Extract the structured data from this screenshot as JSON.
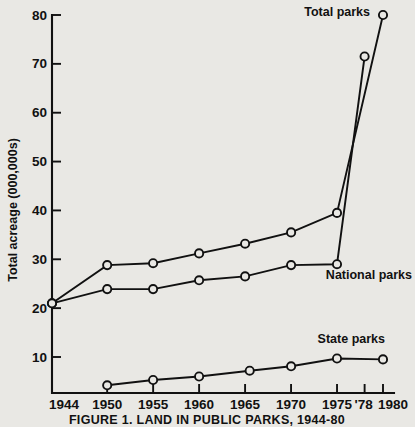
{
  "chart_data": {
    "type": "line",
    "title": "",
    "caption": "FIGURE 1.  LAND IN PUBLIC PARKS, 1944-80",
    "xlabel": "",
    "ylabel": "Total acreage (000,000s)",
    "x_tick_labels": [
      "1944",
      "1950",
      "1955",
      "1960",
      "1965",
      "1970",
      "1975",
      "'78",
      "1980"
    ],
    "x_tick_values": [
      1944,
      1950,
      1955,
      1960,
      1965,
      1970,
      1975,
      1978,
      1980
    ],
    "y_tick_labels": [
      "10",
      "20",
      "30",
      "40",
      "50",
      "60",
      "70",
      "80"
    ],
    "y_tick_values": [
      10,
      20,
      30,
      40,
      50,
      60,
      70,
      80
    ],
    "xlim": [
      1944,
      1980
    ],
    "ylim": [
      2,
      82
    ],
    "grid": false,
    "legend_position": "inline-annotations",
    "marker": "open-circle",
    "line_color": "#111111",
    "background_color": "#e9e8e4",
    "series": [
      {
        "name": "Total parks",
        "label": "Total parks",
        "x": [
          1944,
          1950,
          1955,
          1960,
          1965,
          1970,
          1975,
          1980
        ],
        "values": [
          21.0,
          28.8,
          29.2,
          31.2,
          33.2,
          35.5,
          39.5,
          80.0
        ]
      },
      {
        "name": "National parks",
        "label": "National parks",
        "x": [
          1944,
          1950,
          1955,
          1960,
          1965,
          1970,
          1975,
          1978
        ],
        "values": [
          21.0,
          23.9,
          23.9,
          25.7,
          26.5,
          28.8,
          29.0,
          71.5
        ]
      },
      {
        "name": "State parks",
        "label": "State parks",
        "x": [
          1950,
          1955,
          1960,
          1965.5,
          1970,
          1975,
          1980
        ],
        "values": [
          4.2,
          5.3,
          6.0,
          7.2,
          8.1,
          9.7,
          9.5
        ]
      }
    ]
  }
}
